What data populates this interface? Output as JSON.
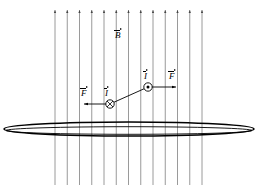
{
  "figure": {
    "background_color": "#ffffff",
    "line_color": "#808080",
    "ink_color": "#000000",
    "width": 259,
    "height": 193
  },
  "field": {
    "label": "B",
    "label_text": "B",
    "description": "uniform magnetic field directed upward out of the page plane",
    "direction": "up",
    "line_count": 13,
    "line_x_start": 55,
    "line_x_end": 202,
    "line_y_top": 10,
    "line_y_bottom": 185,
    "label_x": 114,
    "label_y": 28,
    "color": "#808080"
  },
  "loop": {
    "name": "current-loop-ellipse",
    "description": "flat current loop seen edge on",
    "center_x": 129,
    "center_y": 129,
    "radius_x": 125,
    "radius_y": 7,
    "color": "#000000"
  },
  "elements": [
    {
      "id": "left",
      "marker": "cross",
      "marker_symbol": "x",
      "meaning": "current into the page",
      "current_label": "I",
      "force_label": "F",
      "force_direction": "left",
      "x": 110,
      "y": 104,
      "radius": 4.2,
      "current_label_x": 104,
      "current_label_y": 86,
      "force_label_x": 80,
      "force_label_y": 86,
      "force_arrow_from_x": 106,
      "force_arrow_to_x": 84,
      "force_arrow_y": 104
    },
    {
      "id": "right",
      "marker": "dot",
      "marker_symbol": "•",
      "meaning": "current out of the page",
      "current_label": "I",
      "force_label": "F",
      "force_direction": "right",
      "x": 148,
      "y": 87,
      "radius": 4.2,
      "current_label_x": 143,
      "current_label_y": 69,
      "force_label_x": 168,
      "force_label_y": 69,
      "force_arrow_from_x": 152,
      "force_arrow_to_x": 176,
      "force_arrow_y": 87
    }
  ],
  "wire": {
    "name": "current-wire-segment",
    "from_x": 110,
    "from_y": 104,
    "to_x": 148,
    "to_y": 87,
    "color": "#000000"
  }
}
